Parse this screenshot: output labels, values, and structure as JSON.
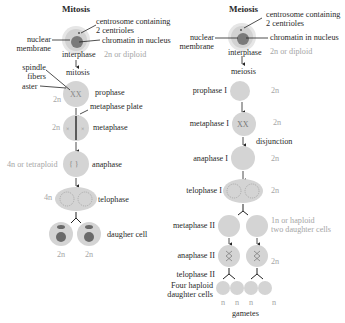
{
  "mitosis": {
    "title": "Mitosis",
    "callouts": {
      "centrosome": [
        "centrosome containing",
        "2 centrioles"
      ],
      "chromatin": "chromatin in nucleus",
      "nuclear_membrane": [
        "nuclear",
        "membrane"
      ],
      "spindle": [
        "spindle",
        "fibers"
      ],
      "aster": "aster",
      "metaphase_plate": "metaphase plate"
    },
    "stages": [
      {
        "name": "interphase",
        "ploidy": "2n or diploid"
      },
      {
        "name": "mitosis",
        "ploidy": ""
      },
      {
        "name": "prophase",
        "ploidy": "2n"
      },
      {
        "name": "metaphase",
        "ploidy": "2n"
      },
      {
        "name": "anaphase",
        "ploidy": "4n or tetraploid"
      },
      {
        "name": "telophase",
        "ploidy": "4n"
      },
      {
        "name": "daugher cell",
        "ploidy": "2n"
      }
    ],
    "daughter_ploidy": [
      "2n",
      "2n"
    ]
  },
  "meiosis": {
    "title": "Meiosis",
    "callouts": {
      "centrosome": [
        "centrosome containing",
        "2 centrioles"
      ],
      "chromatin": "chromatin in nucleus",
      "nuclear_membrane": [
        "nuclear",
        "membrane"
      ],
      "disjunction": "disjunction"
    },
    "stages": [
      {
        "name": "interphase",
        "ploidy": "2n or diploid"
      },
      {
        "name": "meiosis",
        "ploidy": ""
      },
      {
        "name": "prophase I",
        "ploidy": "2n"
      },
      {
        "name": "metaphase I",
        "ploidy": "2n"
      },
      {
        "name": "anaphase I",
        "ploidy": "2n"
      },
      {
        "name": "telophase I",
        "ploidy": "2n"
      },
      {
        "name": "metaphase II",
        "ploidy": [
          "1n or haploid",
          "two daughter cells"
        ]
      },
      {
        "name": "anaphase II",
        "ploidy": "2n"
      },
      {
        "name": "telophase II",
        "ploidy": ""
      }
    ],
    "final": {
      "label": [
        "Four haploid",
        "daughter cells"
      ],
      "ploidy": [
        "n",
        "n",
        "n",
        "n"
      ],
      "caption": "gametes"
    }
  },
  "colors": {
    "cell": "#cfcfcf",
    "cell_outer": "#e4e4e4",
    "nucleus": "#7a7a7a",
    "ploidy_text": "#a6a6a6",
    "line": "#222222"
  }
}
